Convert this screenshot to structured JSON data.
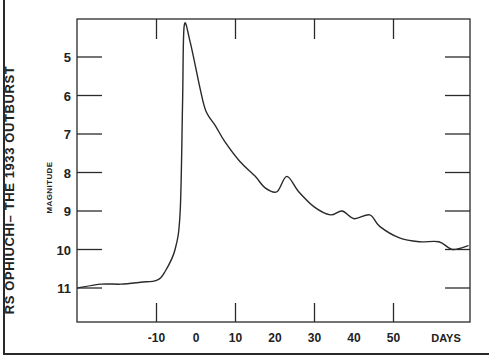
{
  "chart_data": {
    "type": "line",
    "title": "RS OPHIUCHI– THE 1933 OUTBURST",
    "xlabel": "DAYS",
    "ylabel": "MAGNITUDE",
    "x_ticks": [
      -10,
      0,
      10,
      20,
      30,
      40,
      50
    ],
    "x_tick_labels": [
      "-10",
      "0",
      "10",
      "20",
      "30",
      "40",
      "50"
    ],
    "y_ticks": [
      5,
      6,
      7,
      8,
      9,
      10,
      11
    ],
    "y_tick_labels": [
      "5",
      "6",
      "7",
      "8",
      "9",
      "10",
      "11"
    ],
    "xlim": [
      -30,
      69
    ],
    "ylim": [
      12,
      4.0
    ],
    "y_inverted": true,
    "grid": false,
    "series": [
      {
        "name": "RS Ophiuchi 1933 light curve",
        "x": [
          -30,
          -24,
          -19,
          -14,
          -10,
          -8,
          -5.3,
          -4,
          -3.4,
          -3,
          -1.5,
          1,
          2.5,
          5,
          7.3,
          11,
          15,
          17.5,
          20.5,
          23,
          26,
          30,
          34,
          37,
          40,
          44,
          46.5,
          51.5,
          56.5,
          61.5,
          65,
          69
        ],
        "values": [
          11.0,
          10.9,
          10.9,
          10.85,
          10.8,
          10.6,
          10.0,
          9.0,
          6.2,
          4.2,
          4.6,
          5.8,
          6.4,
          6.8,
          7.2,
          7.7,
          8.1,
          8.4,
          8.5,
          8.1,
          8.5,
          8.9,
          9.1,
          9.0,
          9.2,
          9.1,
          9.4,
          9.7,
          9.8,
          9.8,
          10.0,
          9.9
        ]
      }
    ]
  },
  "colors": {
    "ink": "#2a2a2a",
    "background": "#ffffff"
  }
}
